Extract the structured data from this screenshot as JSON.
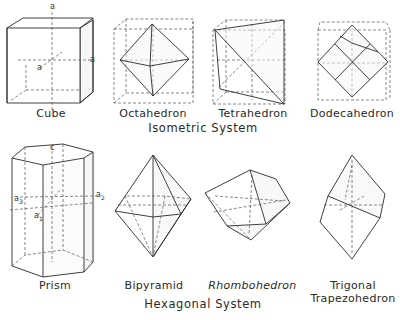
{
  "diagram": {
    "groups": [
      {
        "system_label": "Isometric System",
        "forms": [
          {
            "name": "Cube",
            "axes": [
              "a",
              "a",
              "a"
            ]
          },
          {
            "name": "Octahedron"
          },
          {
            "name": "Tetrahedron"
          },
          {
            "name": "Dodecahedron"
          }
        ]
      },
      {
        "system_label": "Hexagonal System",
        "forms": [
          {
            "name": "Prism",
            "axes": [
              "c",
              "a3",
              "a2",
              "a1"
            ]
          },
          {
            "name": "Bipyramid"
          },
          {
            "name": "Rhombohedron"
          },
          {
            "name": "Trigonal",
            "name_line2": "Trapezohedron"
          }
        ]
      }
    ],
    "axis_labels": {
      "cube_top": "a",
      "cube_right": "a",
      "cube_front": "a",
      "prism_c": "c",
      "prism_a3": "a",
      "prism_a3_sub": "3",
      "prism_a2": "a",
      "prism_a2_sub": "2",
      "prism_a1": "a",
      "prism_a1_sub": "1"
    },
    "colors": {
      "ink": "#2a2a2a",
      "dashed": "#555555",
      "stipple": "#bdbdbd",
      "background": "#ffffff"
    }
  }
}
